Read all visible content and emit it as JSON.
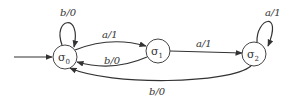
{
  "diagram": {
    "type": "finite-state-machine",
    "colors": {
      "stroke": "#333333",
      "background": "#ffffff"
    },
    "start_state": "s0",
    "states": [
      {
        "id": "s0",
        "symbol": "σ",
        "subscript": "0"
      },
      {
        "id": "s1",
        "symbol": "σ",
        "subscript": "1"
      },
      {
        "id": "s2",
        "symbol": "σ",
        "subscript": "2"
      }
    ],
    "transitions": [
      {
        "from": "s0",
        "to": "s0",
        "label": "b/0"
      },
      {
        "from": "s0",
        "to": "s1",
        "label": "a/1"
      },
      {
        "from": "s1",
        "to": "s0",
        "label": "b/0"
      },
      {
        "from": "s1",
        "to": "s2",
        "label": "a/1"
      },
      {
        "from": "s2",
        "to": "s2",
        "label": "a/1"
      },
      {
        "from": "s2",
        "to": "s0",
        "label": "b/0"
      }
    ]
  }
}
